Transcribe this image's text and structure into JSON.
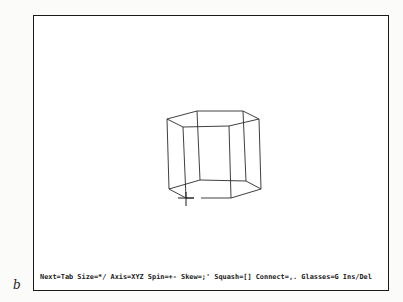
{
  "figure": {
    "label": "b"
  },
  "status_bar": {
    "text": "Next=Tab Size=*/ Axis=XYZ Spin=+- Skew=;' Squash=[] Connect=,. Glasses=G Ins/Del",
    "hints": [
      {
        "action": "Next",
        "key": "Tab"
      },
      {
        "action": "Size",
        "key": "*/"
      },
      {
        "action": "Axis",
        "key": "XYZ"
      },
      {
        "action": "Spin",
        "key": "+-"
      },
      {
        "action": "Skew",
        "key": ";'"
      },
      {
        "action": "Squash",
        "key": "[]"
      },
      {
        "action": "Connect",
        "key": ",."
      },
      {
        "action": "Glasses",
        "key": "G"
      },
      {
        "action": "",
        "key": "Ins/Del"
      }
    ]
  },
  "scene": {
    "object": "hexagonal-prism-wireframe",
    "line_color": "#2a2a2a",
    "top_face": [
      [
        166,
        118
      ],
      [
        196,
        110
      ],
      [
        242,
        110
      ],
      [
        258,
        118
      ],
      [
        228,
        125
      ],
      [
        182,
        126
      ]
    ],
    "bottom_face": [
      [
        168,
        188
      ],
      [
        199,
        179
      ],
      [
        245,
        180
      ],
      [
        260,
        188
      ],
      [
        230,
        197
      ],
      [
        185,
        197
      ]
    ],
    "cursor": {
      "x": 185,
      "y": 197,
      "shape": "crosshair"
    }
  }
}
